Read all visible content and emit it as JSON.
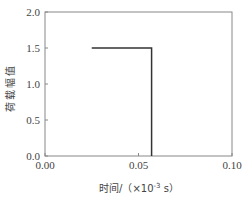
{
  "chart_data": {
    "type": "line",
    "title": "",
    "xlabel": "时间/（×10⁻³ s）",
    "xlabel_parts": {
      "main": "时间/（×10",
      "sup": "-3",
      "unit": " s）"
    },
    "ylabel": "荷载幅值",
    "xlim": [
      0.0,
      0.1
    ],
    "ylim": [
      0.0,
      2.0
    ],
    "xticks": [
      "0.00",
      "0.05",
      "0.10"
    ],
    "yticks": [
      "0.0",
      "0.5",
      "1.0",
      "1.5",
      "2.0"
    ],
    "grid": false,
    "legend": null,
    "series": [
      {
        "name": "load",
        "x": [
          0.025,
          0.057,
          0.057
        ],
        "y": [
          1.5,
          1.5,
          0.0
        ],
        "color": "#333333"
      }
    ]
  }
}
